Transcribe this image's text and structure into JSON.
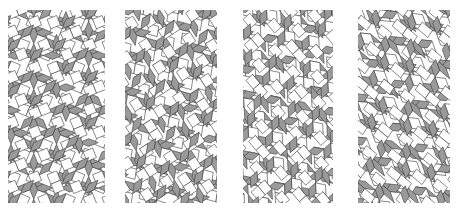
{
  "figure": {
    "tile_colors": {
      "rhomb": "#9a9a9a",
      "square": "#ffffff",
      "edge": "#3a3a3a",
      "background": "#ffffff"
    },
    "panels": [
      {
        "id": "panel-1",
        "x": 8,
        "y": 10,
        "w": 97,
        "h": 193,
        "shear": 0.0,
        "rotation_deg": 22.5,
        "scale": 10.2,
        "offset": [
          0.0,
          0.0
        ]
      },
      {
        "id": "panel-2",
        "x": 125,
        "y": 10,
        "w": 92,
        "h": 193,
        "shear": 0.18,
        "rotation_deg": 14,
        "scale": 10.2,
        "offset": [
          0.3,
          0.1
        ]
      },
      {
        "id": "panel-3",
        "x": 243,
        "y": 10,
        "w": 90,
        "h": 193,
        "shear": 0.38,
        "rotation_deg": 8,
        "scale": 10.2,
        "offset": [
          0.2,
          0.4
        ]
      },
      {
        "id": "panel-4",
        "x": 358,
        "y": 10,
        "w": 92,
        "h": 193,
        "shear": 0.75,
        "rotation_deg": 0,
        "scale": 10.5,
        "offset": [
          0.1,
          0.2
        ]
      }
    ]
  }
}
